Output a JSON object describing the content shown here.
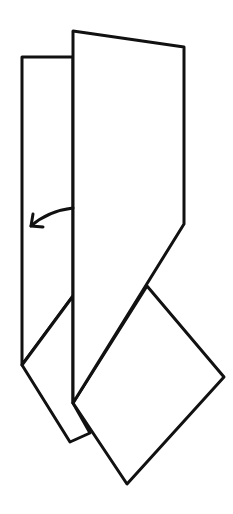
{
  "diagram": {
    "type": "origami-fold-step",
    "stroke_color": "#111111",
    "fill_color": "#ffffff",
    "background": "#ffffff",
    "shapes": {
      "back_layer": "22,57 73,57 73,296 22,365",
      "back_lower_flap": "22,365 70,442 90,433 73,403 73,296",
      "square_flap": "73,403 147,286 224,377 127,484",
      "front_layer": "73,31 184,47 184,224 73,403"
    },
    "arrow": {
      "direction": "left",
      "meaning": "fold-over",
      "path": "M73,208 Q48,211 31,226",
      "head": "31,226"
    }
  }
}
